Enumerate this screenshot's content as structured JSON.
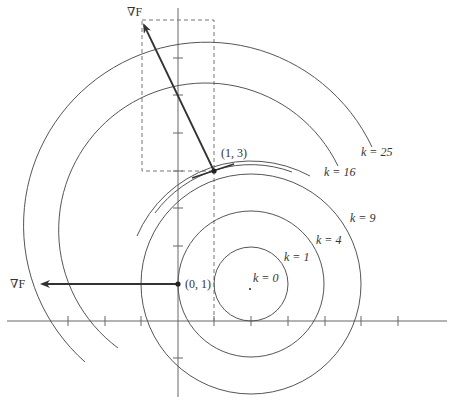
{
  "figure": {
    "colors": {
      "curve": "#555555",
      "axis": "#666666",
      "vector": "#333333",
      "dash": "#777777",
      "text": "#333333"
    },
    "geometry": {
      "origin_px": [
        178,
        321
      ],
      "unit_px": 36.7,
      "center_px": [
        251,
        284
      ],
      "x_ticks_px": [
        68,
        105,
        141,
        214,
        251,
        288,
        325,
        361,
        398
      ],
      "y_ticks_px": [
        58,
        95,
        133,
        171,
        208,
        246,
        284,
        358
      ]
    },
    "level_curves": [
      {
        "label": "k = 0",
        "k": 0,
        "radius_px": 0
      },
      {
        "label": "k = 1",
        "k": 1,
        "radius_px": 37
      },
      {
        "label": "k = 4",
        "k": 4,
        "radius_px": 73
      },
      {
        "label": "k = 9",
        "k": 9,
        "radius_px": 110
      },
      {
        "label": "k = 16",
        "k": 16,
        "radius_px": 147
      },
      {
        "label": "k = 25",
        "k": 25,
        "radius_px": 183
      }
    ],
    "points": [
      {
        "label": "(0, 1)",
        "px": [
          178,
          284
        ]
      },
      {
        "label": "(1, 3)",
        "px": [
          214,
          171
        ]
      }
    ],
    "gradient_vectors": [
      {
        "label": "∇F",
        "from": "(0, 1)",
        "tail_px": [
          178,
          284
        ],
        "head_px": [
          40,
          284
        ]
      },
      {
        "label": "∇F",
        "from": "(1, 3)",
        "tail_px": [
          214,
          171
        ],
        "head_px": [
          142,
          22
        ]
      }
    ],
    "labels": {
      "k0": "k = 0",
      "k1": "k = 1",
      "k4": "k = 4",
      "k9": "k = 9",
      "k16": "k = 16",
      "k25": "k = 25",
      "p01": "(0, 1)",
      "p13": "(1, 3)",
      "grad1": "∇F",
      "grad2": "∇F"
    }
  }
}
